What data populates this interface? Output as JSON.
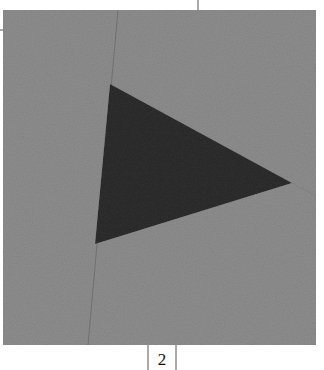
{
  "figure": {
    "page_number": "2",
    "colors": {
      "background": "#ffffff",
      "square": "#8e8e8e",
      "triangle": "#2e2e2e",
      "lines": "#6a6a6a"
    },
    "square": {
      "x": 3,
      "y": 10,
      "width": 313,
      "height": 335
    },
    "triangle": {
      "points": "110,84 292,183 95,244"
    }
  }
}
